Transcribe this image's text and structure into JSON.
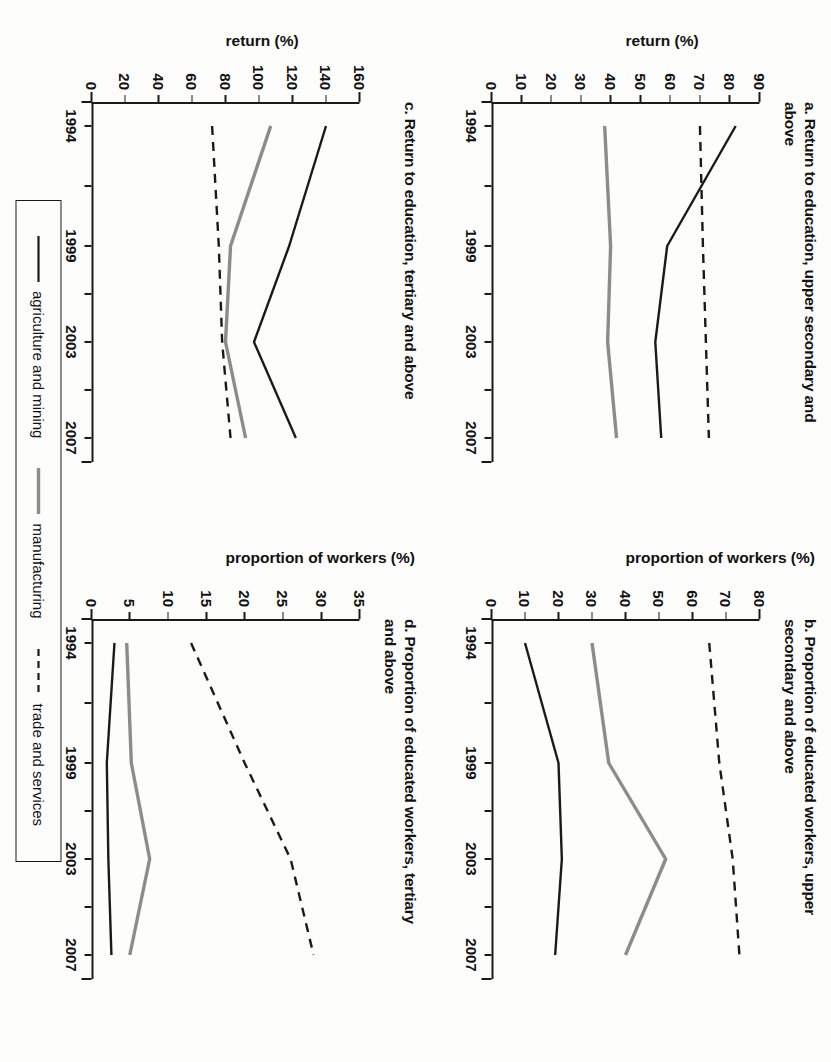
{
  "figure": {
    "panels": [
      {
        "id": "a",
        "title": "a. Return to education, upper secondary and above",
        "ylabel": "return (%)",
        "yticks": [
          "0",
          "10",
          "20",
          "30",
          "40",
          "50",
          "60",
          "70",
          "80",
          "90"
        ],
        "xticks": [
          "1994",
          "1999",
          "2003",
          "2007"
        ]
      },
      {
        "id": "b",
        "title": "b. Proportion of educated workers, upper secondary and above",
        "ylabel": "proportion of workers (%)",
        "yticks": [
          "0",
          "10",
          "20",
          "30",
          "40",
          "50",
          "60",
          "70",
          "80"
        ],
        "xticks": [
          "1994",
          "1999",
          "2003",
          "2007"
        ]
      },
      {
        "id": "c",
        "title": "c. Return to education, tertiary and above",
        "ylabel": "return (%)",
        "yticks": [
          "0",
          "20",
          "40",
          "60",
          "80",
          "100",
          "120",
          "140",
          "160"
        ],
        "xticks": [
          "1994",
          "1999",
          "2003",
          "2007"
        ]
      },
      {
        "id": "d",
        "title": "d. Proportion of educated workers, tertiary and above",
        "ylabel": "proportion of workers (%)",
        "yticks": [
          "0",
          "5",
          "10",
          "15",
          "20",
          "25",
          "30",
          "35"
        ],
        "xticks": [
          "1994",
          "1999",
          "2003",
          "2007"
        ]
      }
    ],
    "legend": [
      {
        "label": "agriculture and mining",
        "style": "solid",
        "color": "#1a1a1a"
      },
      {
        "label": "manufacturing",
        "style": "solid",
        "color": "#8c8c8c"
      },
      {
        "label": "trade and services",
        "style": "dashed",
        "color": "#1a1a1a"
      }
    ]
  },
  "chart_data": [
    {
      "type": "line",
      "panel": "a",
      "title": "a. Return to education, upper secondary and above",
      "xlabel": "",
      "ylabel": "return (%)",
      "x": [
        1994,
        1999,
        2003,
        2007
      ],
      "xlim": [
        1993,
        2008
      ],
      "ylim": [
        0,
        90
      ],
      "ytick_values": [
        0,
        10,
        20,
        30,
        40,
        50,
        60,
        70,
        80,
        90
      ],
      "xtick_values": [
        1994,
        1999,
        2003,
        2007
      ],
      "grid": false,
      "legend_position": "bottom-outside",
      "series": [
        {
          "name": "agriculture and mining",
          "style": "solid",
          "color": "#1a1a1a",
          "values": [
            82,
            59,
            55,
            57
          ]
        },
        {
          "name": "manufacturing",
          "style": "solid",
          "color": "#8c8c8c",
          "values": [
            38,
            40,
            39,
            42
          ]
        },
        {
          "name": "trade and services",
          "style": "dashed",
          "color": "#1a1a1a",
          "values": [
            70,
            71,
            72,
            73
          ]
        }
      ]
    },
    {
      "type": "line",
      "panel": "b",
      "title": "b. Proportion of educated workers, upper secondary and above",
      "xlabel": "",
      "ylabel": "proportion of workers (%)",
      "x": [
        1994,
        1999,
        2003,
        2007
      ],
      "xlim": [
        1993,
        2008
      ],
      "ylim": [
        0,
        80
      ],
      "ytick_values": [
        0,
        10,
        20,
        30,
        40,
        50,
        60,
        70,
        80
      ],
      "xtick_values": [
        1994,
        1999,
        2003,
        2007
      ],
      "grid": false,
      "legend_position": "bottom-outside",
      "series": [
        {
          "name": "agriculture and mining",
          "style": "solid",
          "color": "#1a1a1a",
          "values": [
            10,
            20,
            21,
            19
          ]
        },
        {
          "name": "manufacturing",
          "style": "solid",
          "color": "#8c8c8c",
          "values": [
            30,
            35,
            52,
            40
          ]
        },
        {
          "name": "trade and services",
          "style": "dashed",
          "color": "#1a1a1a",
          "values": [
            65,
            68,
            72,
            74
          ]
        }
      ]
    },
    {
      "type": "line",
      "panel": "c",
      "title": "c. Return to education, tertiary and above",
      "xlabel": "",
      "ylabel": "return (%)",
      "x": [
        1994,
        1999,
        2003,
        2007
      ],
      "xlim": [
        1993,
        2008
      ],
      "ylim": [
        0,
        160
      ],
      "ytick_values": [
        0,
        20,
        40,
        60,
        80,
        100,
        120,
        140,
        160
      ],
      "xtick_values": [
        1994,
        1999,
        2003,
        2007
      ],
      "grid": false,
      "legend_position": "bottom-outside",
      "series": [
        {
          "name": "agriculture and mining",
          "style": "solid",
          "color": "#1a1a1a",
          "values": [
            140,
            118,
            97,
            122
          ]
        },
        {
          "name": "manufacturing",
          "style": "solid",
          "color": "#8c8c8c",
          "values": [
            107,
            83,
            80,
            92
          ]
        },
        {
          "name": "trade and services",
          "style": "dashed",
          "color": "#1a1a1a",
          "values": [
            72,
            76,
            78,
            83
          ]
        }
      ]
    },
    {
      "type": "line",
      "panel": "d",
      "title": "d. Proportion of educated workers, tertiary and above",
      "xlabel": "",
      "ylabel": "proportion of workers (%)",
      "x": [
        1994,
        1999,
        2003,
        2007
      ],
      "xlim": [
        1993,
        2008
      ],
      "ylim": [
        0,
        35
      ],
      "ytick_values": [
        0,
        5,
        10,
        15,
        20,
        25,
        30,
        35
      ],
      "xtick_values": [
        1994,
        1999,
        2003,
        2007
      ],
      "grid": false,
      "legend_position": "bottom-outside",
      "series": [
        {
          "name": "agriculture and mining",
          "style": "solid",
          "color": "#1a1a1a",
          "values": [
            3.0,
            2.0,
            2.2,
            2.6
          ]
        },
        {
          "name": "manufacturing",
          "style": "solid",
          "color": "#8c8c8c",
          "values": [
            4.6,
            5.2,
            7.6,
            5.0
          ]
        },
        {
          "name": "trade and services",
          "style": "dashed",
          "color": "#1a1a1a",
          "values": [
            13,
            20,
            26,
            29
          ]
        }
      ]
    }
  ]
}
